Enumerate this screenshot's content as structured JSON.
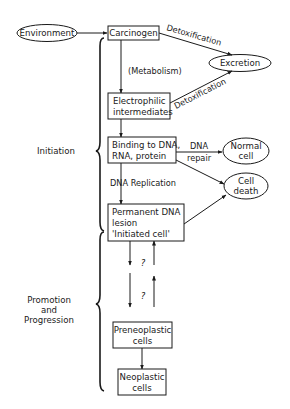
{
  "diagram": {
    "nodes": {
      "environment": "Environment",
      "carcinogen": "Carcinogen",
      "excretion": "Excretion",
      "electrophilic_1": "Electrophilic",
      "electrophilic_2": "intermediates",
      "binding_1": "Binding to DNA,",
      "binding_2": "RNA, protein",
      "normal_cell_1": "Normal",
      "normal_cell_2": "cell",
      "cell_death_1": "Cell",
      "cell_death_2": "death",
      "lesion_1": "Permanent DNA",
      "lesion_2": "lesion",
      "lesion_3": "'Initiated cell'",
      "preneoplastic_1": "Preneoplastic",
      "preneoplastic_2": "cells",
      "neoplastic_1": "Neoplastic",
      "neoplastic_2": "cells"
    },
    "edge_labels": {
      "detox_1": "Detoxification",
      "detox_2": "Detoxification",
      "metabolism": "(Metabolism)",
      "dna_repair_1": "DNA",
      "dna_repair_2": "repair",
      "dna_replication": "DNA Replication",
      "unknown_1": "?",
      "unknown_2": "?"
    },
    "stages": {
      "initiation": "Initiation",
      "promotion_1": "Promotion",
      "promotion_2": "and",
      "promotion_3": "Progression"
    }
  }
}
